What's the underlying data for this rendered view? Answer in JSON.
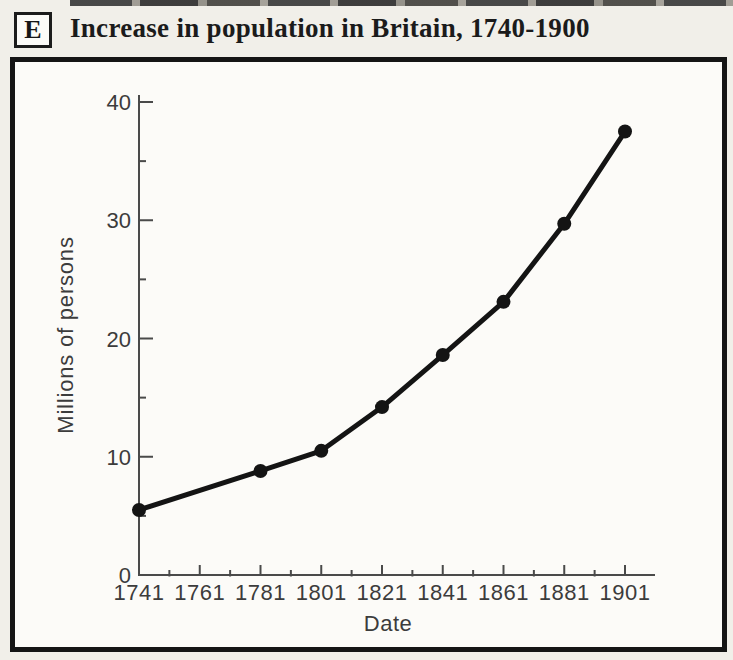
{
  "header": {
    "section_label": "E",
    "title": "Increase in population in Britain, 1740-1900"
  },
  "chart_data": {
    "type": "line",
    "title": "Increase in population in Britain, 1740-1900",
    "xlabel": "Date",
    "ylabel": "Millions of persons",
    "x": [
      1741,
      1781,
      1801,
      1821,
      1841,
      1861,
      1881,
      1901
    ],
    "values": [
      5.5,
      8.8,
      10.5,
      14.2,
      18.6,
      23.1,
      29.7,
      37.5
    ],
    "xlim": [
      1741,
      1911
    ],
    "ylim": [
      0,
      40
    ],
    "x_major_ticks": [
      1741,
      1761,
      1781,
      1801,
      1821,
      1841,
      1861,
      1881,
      1901
    ],
    "x_minor_ticks": [
      1751,
      1771,
      1791,
      1811,
      1831,
      1851,
      1871,
      1891
    ],
    "y_major_ticks": [
      0,
      10,
      20,
      30,
      40
    ],
    "y_minor_ticks": [
      5,
      15,
      25,
      35
    ],
    "grid": false,
    "legend": false,
    "marker": "filled-circle",
    "line_color": "#141414"
  },
  "colors": {
    "ink": "#141414",
    "label_gray": "#3c3c3c",
    "axis_gray": "#4a4a4a",
    "paper": "#f1efe9",
    "chart_bg": "#fcfbf8"
  }
}
